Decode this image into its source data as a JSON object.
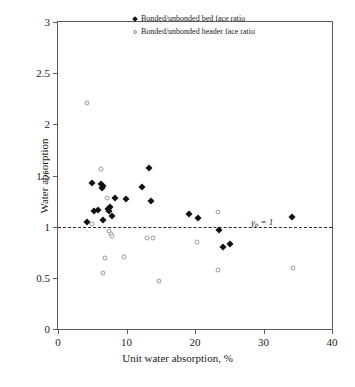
{
  "chart_data": {
    "type": "scatter",
    "title": "",
    "xlabel": "Unit water absorption, %",
    "ylabel": "Water absorption",
    "xlim": [
      0,
      40
    ],
    "ylim": [
      0,
      3
    ],
    "xticks": [
      0,
      10,
      20,
      30,
      40
    ],
    "yticks": [
      0,
      0.5,
      1,
      1.5,
      2,
      2.5,
      3
    ],
    "xtick_labels": [
      "0",
      "10",
      "20",
      "30",
      "40"
    ],
    "ytick_labels": [
      "0",
      "0.5",
      "1",
      "1.5",
      "2",
      "2.5",
      "3"
    ],
    "grid": false,
    "legend_position": "top-right-inside",
    "annotations": [
      {
        "text": "γb = 1",
        "text_main": "γ",
        "text_sub": "b",
        "text_tail": " = 1",
        "x": 28.2,
        "y": 1.09
      }
    ],
    "reference_lines": [
      {
        "name": "gamma-b-unity-line",
        "axis": "horizontal",
        "value": 1,
        "style": "dashed",
        "color": "#2a2a2a"
      }
    ],
    "series": [
      {
        "name": "Bonded/unbonded bed face ratio",
        "marker": "filled-diamond",
        "color": "#101010",
        "points": [
          {
            "x": 4.2,
            "y": 1.05
          },
          {
            "x": 5.0,
            "y": 1.43
          },
          {
            "x": 5.2,
            "y": 1.15
          },
          {
            "x": 5.9,
            "y": 1.16
          },
          {
            "x": 6.3,
            "y": 1.42
          },
          {
            "x": 6.4,
            "y": 1.38
          },
          {
            "x": 6.5,
            "y": 1.4
          },
          {
            "x": 6.6,
            "y": 1.07
          },
          {
            "x": 7.3,
            "y": 1.17
          },
          {
            "x": 7.5,
            "y": 1.15
          },
          {
            "x": 7.6,
            "y": 1.19
          },
          {
            "x": 7.9,
            "y": 1.1
          },
          {
            "x": 8.3,
            "y": 1.28
          },
          {
            "x": 9.9,
            "y": 1.27
          },
          {
            "x": 12.3,
            "y": 1.39
          },
          {
            "x": 13.3,
            "y": 1.57
          },
          {
            "x": 13.6,
            "y": 1.25
          },
          {
            "x": 19.1,
            "y": 1.12
          },
          {
            "x": 20.4,
            "y": 1.08
          },
          {
            "x": 23.5,
            "y": 0.97
          },
          {
            "x": 24.1,
            "y": 0.8
          },
          {
            "x": 25.1,
            "y": 0.83
          },
          {
            "x": 34.1,
            "y": 1.09
          }
        ]
      },
      {
        "name": "Bonded/unbonded header face ratio",
        "marker": "open-circle",
        "color": "#9a9a9a",
        "points": [
          {
            "x": 4.3,
            "y": 2.21
          },
          {
            "x": 4.9,
            "y": 1.03
          },
          {
            "x": 6.3,
            "y": 1.56
          },
          {
            "x": 6.6,
            "y": 0.55
          },
          {
            "x": 6.9,
            "y": 0.69
          },
          {
            "x": 7.2,
            "y": 1.28
          },
          {
            "x": 7.4,
            "y": 0.96
          },
          {
            "x": 7.7,
            "y": 0.93
          },
          {
            "x": 7.9,
            "y": 0.91
          },
          {
            "x": 9.7,
            "y": 0.7
          },
          {
            "x": 13.0,
            "y": 0.89
          },
          {
            "x": 13.8,
            "y": 0.89
          },
          {
            "x": 14.8,
            "y": 0.47
          },
          {
            "x": 20.3,
            "y": 0.85
          },
          {
            "x": 23.3,
            "y": 1.14
          },
          {
            "x": 23.4,
            "y": 0.58
          },
          {
            "x": 34.3,
            "y": 0.6
          }
        ]
      }
    ]
  }
}
